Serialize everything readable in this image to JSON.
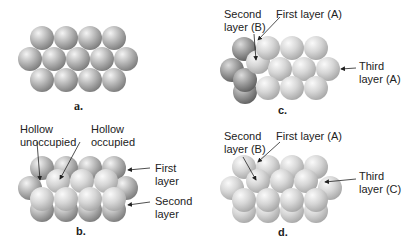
{
  "panels": {
    "a": {
      "caption": "a."
    },
    "b": {
      "caption": "b.",
      "labels": {
        "hollow_unoccupied": [
          "Hollow",
          "unoccupied"
        ],
        "hollow_occupied": [
          "Hollow",
          "occupied"
        ],
        "first_layer": [
          "First",
          "layer"
        ],
        "second_layer": [
          "Second",
          "layer"
        ]
      }
    },
    "c": {
      "caption": "c.",
      "labels": {
        "second_layer": [
          "Second",
          "layer (B)"
        ],
        "first_layer": "First layer (A)",
        "third_layer": [
          "Third",
          "layer (A)"
        ]
      }
    },
    "d": {
      "caption": "d.",
      "labels": {
        "second_layer": [
          "Second",
          "layer (B)"
        ],
        "first_layer": "First layer (A)",
        "third_layer": [
          "Third",
          "layer (C)"
        ]
      }
    }
  },
  "colors": {
    "sphere_dark": "#8a8a8a",
    "sphere_light": "#f2f2f2",
    "sphere_pale_dark": "#b8b8b8",
    "label_text": "#222222",
    "arrow": "#222222"
  }
}
